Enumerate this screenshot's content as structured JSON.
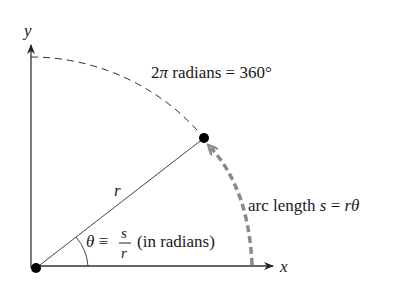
{
  "diagram": {
    "axes": {
      "x_label": "x",
      "y_label": "y"
    },
    "radius_label": "r",
    "full_circle_label": {
      "prefix": "2",
      "pi": "π",
      "text": " radians = 360°"
    },
    "arc_length_label": {
      "text": "arc length ",
      "s": "s",
      "eq": " = ",
      "r": "r",
      "theta": "θ"
    },
    "angle_definition": {
      "theta": "θ",
      "equiv": " ≡ ",
      "numerator": "s",
      "denominator": "r",
      "suffix": "(in radians)"
    },
    "colors": {
      "line": "#333333",
      "arc_arrow": "#8a8a8a",
      "point": "#000000"
    }
  }
}
